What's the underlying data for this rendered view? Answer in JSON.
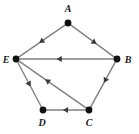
{
  "figure": {
    "kind": "directed-graph-diagram",
    "width": 139,
    "height": 134,
    "background_color": "#ffffff"
  },
  "style": {
    "edge_color": "#808080",
    "edge_width": 1.4,
    "arrow_color": "#3b3b3b",
    "vertex_color": "#111111",
    "vertex_radius": 3.4,
    "label_color": "#1a1a1a",
    "label_font_size": 10
  },
  "vertices": [
    {
      "id": "A",
      "label": "A",
      "x": 68,
      "y": 23,
      "label_x": 68,
      "label_y": 12,
      "label_anchor": "middle"
    },
    {
      "id": "B",
      "label": "B",
      "x": 117,
      "y": 59,
      "label_x": 128,
      "label_y": 63,
      "label_anchor": "middle"
    },
    {
      "id": "C",
      "label": "C",
      "x": 89,
      "y": 110,
      "label_x": 89,
      "label_y": 126,
      "label_anchor": "middle"
    },
    {
      "id": "D",
      "label": "D",
      "x": 43,
      "y": 110,
      "label_x": 42,
      "label_y": 126,
      "label_anchor": "middle"
    },
    {
      "id": "E",
      "label": "E",
      "x": 16,
      "y": 59,
      "label_x": 6,
      "label_y": 63,
      "label_anchor": "middle"
    }
  ],
  "edges": [
    {
      "id": "A-E",
      "from": "A",
      "to": "E",
      "directed": true,
      "arrow_position": 0.52,
      "label": "A to E"
    },
    {
      "id": "A-B",
      "from": "A",
      "to": "B",
      "directed": true,
      "arrow_position": 0.55,
      "label": "A to B"
    },
    {
      "id": "B-E",
      "from": "B",
      "to": "E",
      "directed": true,
      "arrow_position": 0.58,
      "label": "B to E"
    },
    {
      "id": "B-C",
      "from": "B",
      "to": "C",
      "directed": true,
      "arrow_position": 0.42,
      "label": "B to C"
    },
    {
      "id": "C-D",
      "from": "C",
      "to": "D",
      "directed": true,
      "arrow_position": 0.52,
      "label": "C to D"
    },
    {
      "id": "C-E",
      "from": "C",
      "to": "E",
      "directed": true,
      "arrow_position": 0.58,
      "label": "C to E"
    },
    {
      "id": "E-D",
      "from": "E",
      "to": "D",
      "directed": true,
      "arrow_position": 0.5,
      "label": "E to D"
    }
  ]
}
